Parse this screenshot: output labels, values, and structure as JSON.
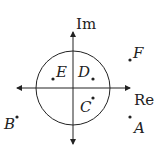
{
  "diagram": {
    "type": "argand-plane",
    "axes": {
      "real_label": "Re",
      "imag_label": "Im"
    },
    "unit_circle": true,
    "colors": {
      "ink": "#222222",
      "background": "#ffffff"
    },
    "points": [
      {
        "label": "A",
        "x": 130,
        "y": 117,
        "lx": 134,
        "ly": 133
      },
      {
        "label": "B",
        "x": 17,
        "y": 117,
        "lx": 4,
        "ly": 129
      },
      {
        "label": "C",
        "x": 93,
        "y": 98,
        "lx": 80,
        "ly": 112
      },
      {
        "label": "D",
        "x": 93,
        "y": 79,
        "lx": 78,
        "ly": 77
      },
      {
        "label": "E",
        "x": 53,
        "y": 79,
        "lx": 56,
        "ly": 77
      },
      {
        "label": "F",
        "x": 130,
        "y": 60,
        "lx": 133,
        "ly": 58
      }
    ]
  }
}
